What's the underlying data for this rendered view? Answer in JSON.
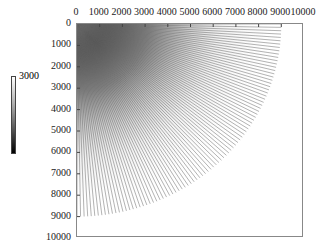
{
  "chart_data": {
    "type": "heatmap",
    "title": "",
    "xlabel": "",
    "ylabel": "",
    "x_ticks": [
      "0",
      "1000",
      "2000",
      "3000",
      "4000",
      "5000",
      "6000",
      "7000",
      "8000",
      "9000",
      "10000"
    ],
    "y_ticks": [
      "0",
      "1000",
      "2000",
      "3000",
      "4000",
      "5000",
      "6000",
      "7000",
      "8000",
      "9000",
      "10000"
    ],
    "xlim": [
      0,
      10000
    ],
    "ylim": [
      10000,
      0
    ],
    "x_axis_position": "top",
    "radius": 9000,
    "colorbar": {
      "max_label": "3000",
      "colormap": "gray (black=low, white=high)"
    }
  }
}
